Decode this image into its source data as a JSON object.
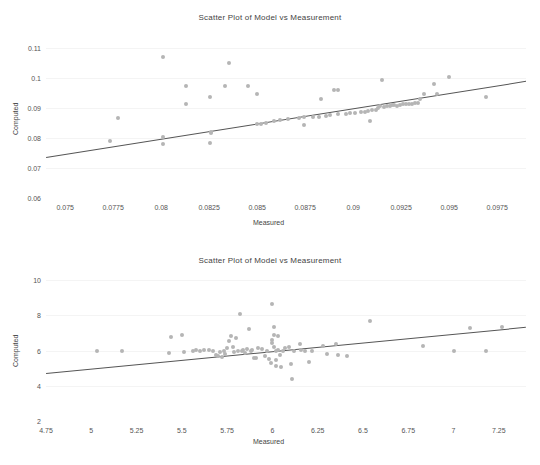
{
  "chart_data": [
    {
      "type": "scatter",
      "title": "Scatter Plot of Model vs Measurement",
      "xlabel": "Measured",
      "ylabel": "Computed",
      "xlim": [
        0.074,
        0.099
      ],
      "ylim": [
        0.06,
        0.1125
      ],
      "xticks": [
        "0.075",
        "0.0775",
        "0.08",
        "0.0825",
        "0.085",
        "0.0875",
        "0.09",
        "0.0925",
        "0.095",
        "0.0975"
      ],
      "xtickvals": [
        0.075,
        0.0775,
        0.08,
        0.0825,
        0.085,
        0.0875,
        0.09,
        0.0925,
        0.095,
        0.0975
      ],
      "yticks": [
        "0.06",
        "0.07",
        "0.08",
        "0.09",
        "0.1",
        "0.11"
      ],
      "ytickvals": [
        0.06,
        0.07,
        0.08,
        0.09,
        0.1,
        0.11
      ],
      "grid": true,
      "legend": "none",
      "marker_color": "#b5b5b5",
      "line_color": "#555555",
      "fit_line": {
        "x0": 0.074,
        "y0": 0.0735,
        "x1": 0.099,
        "y1": 0.0988
      },
      "points": [
        [
          0.07735,
          0.0791
        ],
        [
          0.07775,
          0.0865
        ],
        [
          0.0801,
          0.1068
        ],
        [
          0.0801,
          0.0802
        ],
        [
          0.0801,
          0.0779
        ],
        [
          0.0813,
          0.0972
        ],
        [
          0.0813,
          0.0912
        ],
        [
          0.08255,
          0.0934
        ],
        [
          0.0826,
          0.082
        ],
        [
          0.0826,
          0.0815
        ],
        [
          0.08255,
          0.0783
        ],
        [
          0.0833,
          0.0972
        ],
        [
          0.08355,
          0.1049
        ],
        [
          0.0845,
          0.0972
        ],
        [
          0.085,
          0.0944
        ],
        [
          0.085,
          0.0847
        ],
        [
          0.0852,
          0.0845
        ],
        [
          0.08545,
          0.0849
        ],
        [
          0.08585,
          0.0855
        ],
        [
          0.0862,
          0.0858
        ],
        [
          0.0866,
          0.0861
        ],
        [
          0.0872,
          0.0866
        ],
        [
          0.08745,
          0.0868
        ],
        [
          0.08745,
          0.0843
        ],
        [
          0.0879,
          0.0869
        ],
        [
          0.0882,
          0.087
        ],
        [
          0.0883,
          0.0928
        ],
        [
          0.0886,
          0.0874
        ],
        [
          0.0888,
          0.0876
        ],
        [
          0.089,
          0.0959
        ],
        [
          0.0892,
          0.0959
        ],
        [
          0.0892,
          0.0878
        ],
        [
          0.0896,
          0.0879
        ],
        [
          0.08985,
          0.0882
        ],
        [
          0.0901,
          0.0884
        ],
        [
          0.0904,
          0.0886
        ],
        [
          0.0906,
          0.0887
        ],
        [
          0.09075,
          0.0889
        ],
        [
          0.0909,
          0.0856
        ],
        [
          0.091,
          0.0892
        ],
        [
          0.0912,
          0.0894
        ],
        [
          0.0913,
          0.0899
        ],
        [
          0.0914,
          0.0905
        ],
        [
          0.0915,
          0.0993
        ],
        [
          0.0916,
          0.0902
        ],
        [
          0.09175,
          0.0906
        ],
        [
          0.0919,
          0.0907
        ],
        [
          0.092,
          0.0908
        ],
        [
          0.09215,
          0.0909
        ],
        [
          0.0923,
          0.0907
        ],
        [
          0.09245,
          0.091
        ],
        [
          0.0926,
          0.0911
        ],
        [
          0.09275,
          0.0912
        ],
        [
          0.0929,
          0.0912
        ],
        [
          0.09305,
          0.0913
        ],
        [
          0.0932,
          0.0915
        ],
        [
          0.09335,
          0.0917
        ],
        [
          0.0935,
          0.0929
        ],
        [
          0.0937,
          0.0944
        ],
        [
          0.0942,
          0.0979
        ],
        [
          0.09435,
          0.0944
        ],
        [
          0.095,
          0.1002
        ],
        [
          0.0969,
          0.0934
        ]
      ]
    },
    {
      "type": "scatter",
      "title": "Scatter Plot of Model vs Measurement",
      "xlabel": "Measured",
      "ylabel": "Computed",
      "xlim": [
        4.75,
        7.4
      ],
      "ylim": [
        2,
        10.4
      ],
      "xticks": [
        "4.75",
        "5",
        "5.25",
        "5.5",
        "5.75",
        "6",
        "6.25",
        "6.5",
        "6.75",
        "7",
        "7.25"
      ],
      "xtickvals": [
        4.75,
        5,
        5.25,
        5.5,
        5.75,
        6,
        6.25,
        6.5,
        6.75,
        7,
        7.25
      ],
      "yticks": [
        "2",
        "4",
        "6",
        "8",
        "10"
      ],
      "ytickvals": [
        2,
        4,
        6,
        8,
        10
      ],
      "grid": true,
      "legend": "none",
      "marker_color": "#b5b5b5",
      "line_color": "#555555",
      "fit_line": {
        "x0": 4.75,
        "y0": 4.74,
        "x1": 7.4,
        "y1": 7.36
      },
      "points": [
        [
          5.03,
          6.0
        ],
        [
          5.17,
          6.0
        ],
        [
          5.43,
          5.85
        ],
        [
          5.44,
          6.75
        ],
        [
          5.5,
          6.88
        ],
        [
          5.51,
          5.93
        ],
        [
          5.56,
          5.98
        ],
        [
          5.58,
          6.02
        ],
        [
          5.6,
          5.95
        ],
        [
          5.62,
          6.05
        ],
        [
          5.65,
          6.02
        ],
        [
          5.67,
          5.98
        ],
        [
          5.69,
          5.77
        ],
        [
          5.7,
          5.7
        ],
        [
          5.71,
          5.9
        ],
        [
          5.72,
          5.62
        ],
        [
          5.73,
          6.0
        ],
        [
          5.74,
          5.83
        ],
        [
          5.75,
          6.15
        ],
        [
          5.76,
          6.55
        ],
        [
          5.77,
          6.85
        ],
        [
          5.78,
          6.2
        ],
        [
          5.79,
          5.92
        ],
        [
          5.8,
          6.7
        ],
        [
          5.81,
          5.95
        ],
        [
          5.82,
          8.05
        ],
        [
          5.83,
          6.0
        ],
        [
          5.84,
          6.05
        ],
        [
          5.85,
          5.88
        ],
        [
          5.86,
          6.1
        ],
        [
          5.87,
          7.25
        ],
        [
          5.88,
          5.95
        ],
        [
          5.89,
          6.02
        ],
        [
          5.9,
          5.6
        ],
        [
          5.91,
          5.55
        ],
        [
          5.92,
          6.12
        ],
        [
          5.94,
          6.08
        ],
        [
          5.96,
          5.7
        ],
        [
          5.97,
          6.0
        ],
        [
          5.98,
          5.52
        ],
        [
          5.99,
          5.3
        ],
        [
          6.0,
          6.4
        ],
        [
          6.0,
          6.6
        ],
        [
          6.0,
          8.65
        ],
        [
          6.01,
          7.35
        ],
        [
          6.01,
          6.9
        ],
        [
          6.01,
          6.2
        ],
        [
          6.02,
          5.95
        ],
        [
          6.02,
          5.45
        ],
        [
          6.02,
          5.1
        ],
        [
          6.03,
          6.05
        ],
        [
          6.03,
          6.85
        ],
        [
          6.04,
          5.75
        ],
        [
          6.05,
          5.05
        ],
        [
          6.06,
          6.0
        ],
        [
          6.07,
          6.15
        ],
        [
          6.09,
          6.2
        ],
        [
          6.1,
          5.25
        ],
        [
          6.11,
          4.4
        ],
        [
          6.12,
          6.0
        ],
        [
          6.15,
          6.35
        ],
        [
          6.16,
          6.05
        ],
        [
          6.18,
          5.95
        ],
        [
          6.2,
          5.35
        ],
        [
          6.22,
          6.0
        ],
        [
          6.28,
          6.25
        ],
        [
          6.3,
          5.8
        ],
        [
          6.35,
          6.35
        ],
        [
          6.36,
          5.72
        ],
        [
          6.41,
          5.7
        ],
        [
          6.54,
          7.7
        ],
        [
          6.83,
          6.25
        ],
        [
          7.0,
          6.0
        ],
        [
          7.09,
          7.28
        ],
        [
          7.18,
          6.0
        ],
        [
          7.27,
          7.35
        ]
      ]
    }
  ]
}
